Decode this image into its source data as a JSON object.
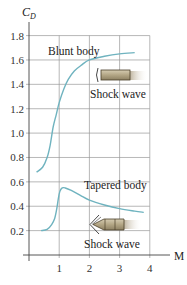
{
  "chart_data": {
    "type": "line",
    "title": "",
    "xlabel": "M",
    "ylabel": "C_D",
    "xlim": [
      0,
      4
    ],
    "ylim": [
      0,
      1.9
    ],
    "grid": true,
    "x_ticks": [
      "1",
      "2",
      "3",
      "4"
    ],
    "y_ticks": [
      "0.2",
      "0.4",
      "0.6",
      "0.8",
      "1.0",
      "1.2",
      "1.4",
      "1.6",
      "1.8"
    ],
    "series": [
      {
        "name": "Blunt body",
        "color": "#6fb3bf",
        "x": [
          0.25,
          0.45,
          0.6,
          0.7,
          0.8,
          0.9,
          1.0,
          1.15,
          1.3,
          1.5,
          1.75,
          2.0,
          2.5,
          3.0,
          3.5
        ],
        "y": [
          0.68,
          0.72,
          0.8,
          0.9,
          1.05,
          1.15,
          1.25,
          1.36,
          1.44,
          1.51,
          1.56,
          1.6,
          1.63,
          1.65,
          1.66
        ]
      },
      {
        "name": "Tapered body",
        "color": "#6fb3bf",
        "x": [
          0.4,
          0.6,
          0.75,
          0.85,
          0.92,
          0.97,
          1.02,
          1.1,
          1.2,
          1.4,
          1.7,
          2.0,
          2.5,
          3.0,
          3.5,
          3.8
        ],
        "y": [
          0.2,
          0.21,
          0.25,
          0.3,
          0.38,
          0.46,
          0.52,
          0.55,
          0.55,
          0.53,
          0.49,
          0.45,
          0.41,
          0.38,
          0.36,
          0.35
        ]
      }
    ],
    "annotations": [
      {
        "text": "Blunt body",
        "x": 1.1,
        "y": 1.7
      },
      {
        "text": "Shock wave",
        "x": 2.1,
        "y": 1.3
      },
      {
        "text": "Tapered body",
        "x": 2.5,
        "y": 0.58
      },
      {
        "text": "Shock wave",
        "x": 2.0,
        "y": 0.1
      }
    ]
  },
  "labels": {
    "ylabel": "C",
    "ylabel_sub": "D",
    "xlabel": "M",
    "blunt": "Blunt body",
    "shock1": "Shock wave",
    "tapered": "Tapered body",
    "shock2": "Shock wave"
  }
}
